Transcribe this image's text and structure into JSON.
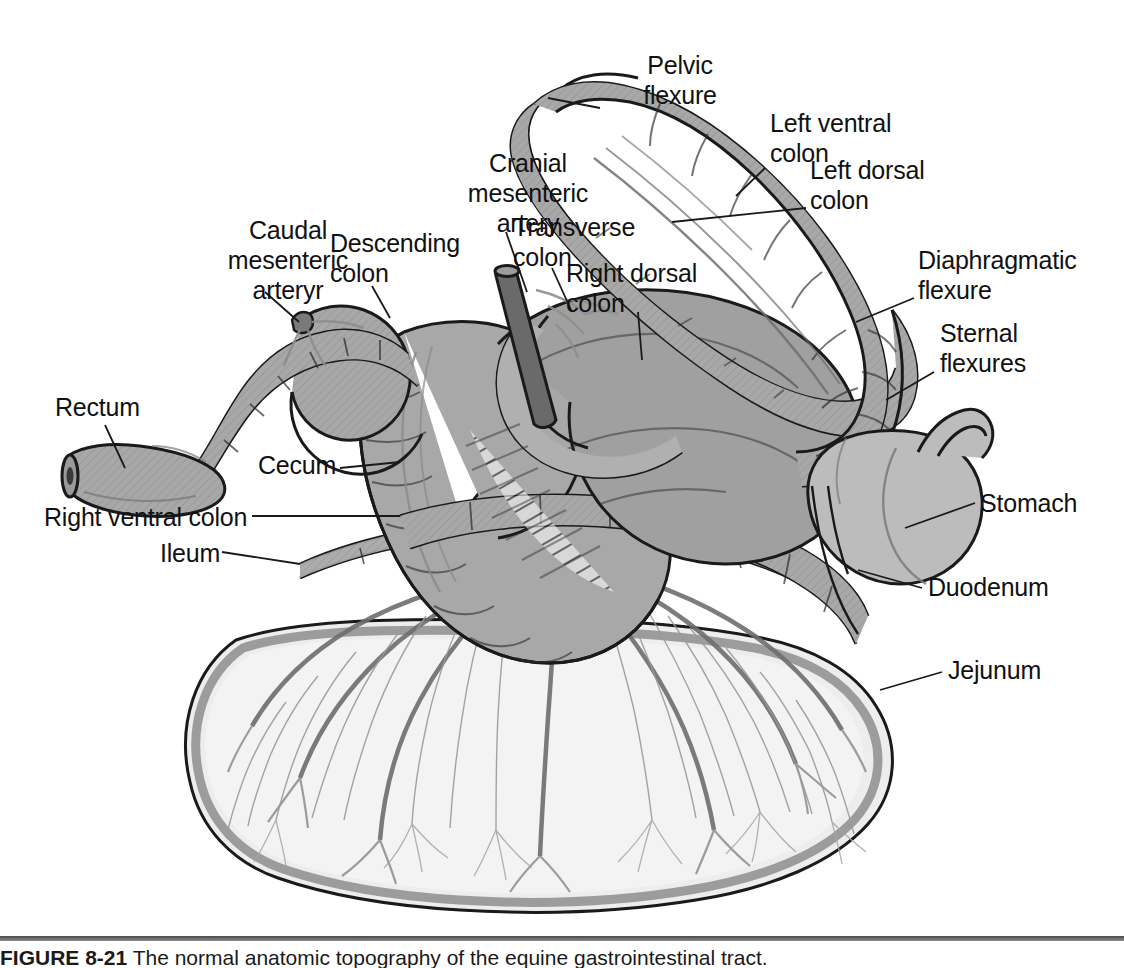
{
  "figure": {
    "caption_number": "FIGURE 8-21",
    "caption_text": "The normal anatomic topography of the equine gastrointestinal tract."
  },
  "palette": {
    "colon_fill": "#a8a8a8",
    "colon_fill_dark": "#9a9a9a",
    "stomach_fill": "#b8b8b8",
    "jejunum_fill": "#ededed",
    "mesentery_fill": "#f2f2f2",
    "artery_fill": "#6a6a6a",
    "outline": "#1a1a1a",
    "vessel_line": "#8a8a8a",
    "background": "#ffffff",
    "label_color": "#111111"
  },
  "labels": [
    {
      "id": "pelvic-flexure",
      "text": "Pelvic\nflexure",
      "x": 590,
      "y": 50,
      "align": "center",
      "leader": [
        [
          600,
          108
        ],
        [
          548,
          98
        ]
      ]
    },
    {
      "id": "left-ventral-colon",
      "text": "Left ventral\ncolon",
      "x": 770,
      "y": 108,
      "align": "left",
      "leader": [
        [
          765,
          168
        ],
        [
          736,
          196
        ]
      ]
    },
    {
      "id": "left-dorsal-colon",
      "text": "Left dorsal\ncolon",
      "x": 810,
      "y": 155,
      "align": "left",
      "leader": [
        [
          806,
          208
        ],
        [
          672,
          222
        ]
      ]
    },
    {
      "id": "diaphragmatic-flexure",
      "text": "Diaphragmatic\nflexure",
      "x": 918,
      "y": 245,
      "align": "left",
      "leader": [
        [
          914,
          298
        ],
        [
          856,
          322
        ]
      ]
    },
    {
      "id": "sternal-flexures",
      "text": "Sternal\nflexures",
      "x": 940,
      "y": 318,
      "align": "left",
      "leader": [
        [
          934,
          372
        ],
        [
          886,
          400
        ]
      ]
    },
    {
      "id": "cranial-mesenteric-artery",
      "text": "Cranial\nmesenteric\nartery",
      "x": 438,
      "y": 148,
      "align": "center",
      "leader": [
        [
          506,
          232
        ],
        [
          527,
          292
        ]
      ]
    },
    {
      "id": "transverse-colon",
      "text": "Transverse\ncolon",
      "x": 513,
      "y": 212,
      "align": "left",
      "leader": [
        [
          552,
          268
        ],
        [
          572,
          312
        ]
      ]
    },
    {
      "id": "right-dorsal-colon",
      "text": "Right dorsal\ncolon",
      "x": 566,
      "y": 258,
      "align": "left",
      "leader": [
        [
          638,
          312
        ],
        [
          642,
          360
        ]
      ]
    },
    {
      "id": "caudal-mesenteric-artery",
      "text": "Caudal\nmesenteric\narteryr",
      "x": 198,
      "y": 215,
      "align": "center",
      "leader": [
        [
          265,
          292
        ],
        [
          299,
          322
        ]
      ]
    },
    {
      "id": "descending-colon",
      "text": "Descending\ncolon",
      "x": 330,
      "y": 228,
      "align": "left",
      "leader": [
        [
          372,
          286
        ],
        [
          390,
          318
        ]
      ]
    },
    {
      "id": "rectum",
      "text": "Rectum",
      "x": 55,
      "y": 392,
      "align": "left",
      "leader": [
        [
          105,
          425
        ],
        [
          125,
          468
        ]
      ]
    },
    {
      "id": "cecum",
      "text": "Cecum",
      "x": 258,
      "y": 450,
      "align": "left",
      "leader": [
        [
          340,
          468
        ],
        [
          400,
          462
        ]
      ]
    },
    {
      "id": "right-ventral-colon",
      "text": "Right ventral colon",
      "x": 44,
      "y": 502,
      "align": "left",
      "leader": [
        [
          252,
          516
        ],
        [
          400,
          516
        ]
      ]
    },
    {
      "id": "ileum",
      "text": "Ileum",
      "x": 160,
      "y": 538,
      "align": "left",
      "leader": [
        [
          222,
          552
        ],
        [
          300,
          564
        ]
      ]
    },
    {
      "id": "stomach",
      "text": "Stomach",
      "x": 980,
      "y": 488,
      "align": "left",
      "leader": [
        [
          975,
          503
        ],
        [
          905,
          528
        ]
      ]
    },
    {
      "id": "duodenum",
      "text": "Duodenum",
      "x": 928,
      "y": 572,
      "align": "left",
      "leader": [
        [
          922,
          588
        ],
        [
          858,
          570
        ]
      ]
    },
    {
      "id": "jejunum",
      "text": "Jejunum",
      "x": 948,
      "y": 655,
      "align": "left",
      "leader": [
        [
          942,
          672
        ],
        [
          880,
          690
        ]
      ]
    }
  ],
  "structures": [
    {
      "id": "left-ventral-colon",
      "name": "Left ventral colon"
    },
    {
      "id": "left-dorsal-colon",
      "name": "Left dorsal colon"
    },
    {
      "id": "pelvic-flexure",
      "name": "Pelvic flexure"
    },
    {
      "id": "diaphragmatic-flexure",
      "name": "Diaphragmatic flexure"
    },
    {
      "id": "sternal-flexures",
      "name": "Sternal flexures"
    },
    {
      "id": "right-dorsal-colon",
      "name": "Right dorsal colon"
    },
    {
      "id": "right-ventral-colon",
      "name": "Right ventral colon"
    },
    {
      "id": "transverse-colon",
      "name": "Transverse colon"
    },
    {
      "id": "descending-colon",
      "name": "Descending colon"
    },
    {
      "id": "rectum",
      "name": "Rectum"
    },
    {
      "id": "cecum",
      "name": "Cecum"
    },
    {
      "id": "ileum",
      "name": "Ileum"
    },
    {
      "id": "jejunum",
      "name": "Jejunum"
    },
    {
      "id": "duodenum",
      "name": "Duodenum"
    },
    {
      "id": "stomach",
      "name": "Stomach"
    },
    {
      "id": "cranial-mesenteric-artery",
      "name": "Cranial mesenteric artery"
    },
    {
      "id": "caudal-mesenteric-artery",
      "name": "Caudal mesenteric artery"
    }
  ]
}
